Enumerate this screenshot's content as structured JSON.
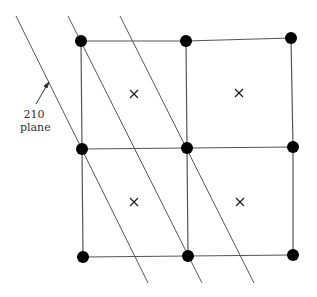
{
  "label": {
    "line1": "210",
    "line2": "plane"
  },
  "lattice_points": [
    {
      "x": 81,
      "y": 41
    },
    {
      "x": 186,
      "y": 41
    },
    {
      "x": 291,
      "y": 38
    },
    {
      "x": 82,
      "y": 149
    },
    {
      "x": 187,
      "y": 148
    },
    {
      "x": 293,
      "y": 147
    },
    {
      "x": 83,
      "y": 257
    },
    {
      "x": 188,
      "y": 256
    },
    {
      "x": 293,
      "y": 255
    }
  ],
  "center_marks": [
    {
      "x": 134,
      "y": 94
    },
    {
      "x": 239,
      "y": 93
    },
    {
      "x": 134,
      "y": 202
    },
    {
      "x": 240,
      "y": 202
    }
  ],
  "planes": [
    {
      "x1": 16,
      "y1": 16,
      "x2": 148,
      "y2": 283
    },
    {
      "x1": 68,
      "y1": 16,
      "x2": 202,
      "y2": 283
    },
    {
      "x1": 120,
      "y1": 16,
      "x2": 254,
      "y2": 283
    }
  ],
  "colors": {
    "line": "#555555",
    "dot": "#000000"
  }
}
